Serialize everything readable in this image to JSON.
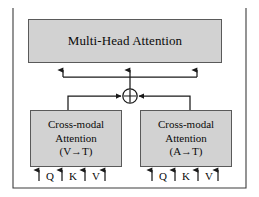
{
  "figure": {
    "type": "block-diagram",
    "title_text": "",
    "colors": {
      "box_fill": "#d2d2d2",
      "box_stroke": "#5a5a5a",
      "line": "#1a1a1a",
      "background": "#ffffff",
      "text": "#0a0a0a"
    }
  },
  "nodes": {
    "multi_head_attention": {
      "label": "Multi-Head Attention",
      "shape": "rectangle",
      "fill": "#d2d2d2"
    },
    "cross_modal_vt": {
      "line1": "Cross-modal",
      "line2": "Attention",
      "line3": "(V→T)",
      "shape": "rectangle",
      "fill": "#d2d2d2"
    },
    "cross_modal_at": {
      "line1": "Cross-modal",
      "line2": "Attention",
      "line3": "(A→T)",
      "shape": "rectangle",
      "fill": "#d2d2d2"
    },
    "sum_operator": {
      "symbol": "⊕",
      "name": "element-wise addition",
      "shape": "circle-with-cross"
    }
  },
  "inputs": {
    "left_group": {
      "labels": [
        "Q",
        "K",
        "V"
      ]
    },
    "right_group": {
      "labels": [
        "Q",
        "K",
        "V"
      ]
    }
  },
  "edges": [
    {
      "from": "inputs_left",
      "to": "cross_modal_vt",
      "style": "arrow-up"
    },
    {
      "from": "inputs_right",
      "to": "cross_modal_at",
      "style": "arrow-up"
    },
    {
      "from": "cross_modal_vt",
      "to": "sum_operator",
      "style": "elbow-arrow"
    },
    {
      "from": "cross_modal_at",
      "to": "sum_operator",
      "style": "elbow-arrow"
    },
    {
      "from": "sum_operator",
      "to": "multi_head_attention",
      "style": "fan-out-3-arrows"
    }
  ]
}
